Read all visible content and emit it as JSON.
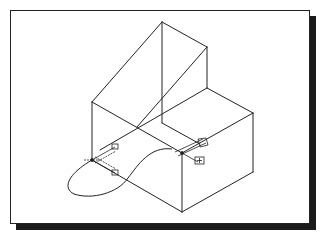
{
  "figure": {
    "colors": {
      "background": "#ffffff",
      "line": "#222222",
      "frame": "#222222",
      "shadow": "#1a1a1a"
    },
    "frame": {
      "x": 10,
      "y": 10,
      "width": 300,
      "height": 214,
      "shadow_offset": 6
    },
    "edges": [
      {
        "name": "wedge-left-slope",
        "points": [
          [
            92,
            102
          ],
          [
            162,
            22
          ]
        ]
      },
      {
        "name": "wedge-top-edge",
        "points": [
          [
            162,
            22
          ],
          [
            207,
            47
          ]
        ]
      },
      {
        "name": "wedge-right-vertical",
        "points": [
          [
            207,
            47
          ],
          [
            207,
            88
          ]
        ]
      },
      {
        "name": "center-vertical",
        "points": [
          [
            162,
            22
          ],
          [
            162,
            123
          ]
        ]
      },
      {
        "name": "wedge-diagonal",
        "points": [
          [
            207,
            47
          ],
          [
            137,
            127
          ]
        ]
      },
      {
        "name": "left-vertical",
        "points": [
          [
            92,
            102
          ],
          [
            92,
            160
          ]
        ]
      },
      {
        "name": "front-top-edge",
        "points": [
          [
            92,
            102
          ],
          [
            182,
            153
          ]
        ]
      },
      {
        "name": "step-front-edge",
        "points": [
          [
            207,
            88
          ],
          [
            100,
            150
          ]
        ]
      },
      {
        "name": "inner-step-edge",
        "points": [
          [
            162,
            123
          ],
          [
            200,
            144
          ]
        ]
      },
      {
        "name": "step-right-edge",
        "points": [
          [
            207,
            88
          ],
          [
            253,
            113
          ]
        ]
      },
      {
        "name": "box-right-vertical",
        "points": [
          [
            253,
            113
          ],
          [
            253,
            172
          ]
        ]
      },
      {
        "name": "box-top-front-edge",
        "points": [
          [
            253,
            113
          ],
          [
            182,
            153
          ]
        ]
      },
      {
        "name": "box-front-vertical",
        "points": [
          [
            182,
            153
          ],
          [
            182,
            212
          ]
        ]
      },
      {
        "name": "box-bottom-right-edge",
        "points": [
          [
            182,
            212
          ],
          [
            253,
            172
          ]
        ]
      },
      {
        "name": "base-left-edge",
        "points": [
          [
            92,
            160
          ],
          [
            182,
            212
          ]
        ]
      }
    ],
    "curve": {
      "name": "freeform-path",
      "d": "M172,149 C150,146 138,165 128,178 C118,193 92,200 74,194 C62,188 68,174 92,160"
    },
    "markers": [
      {
        "name": "left-dimension-marker",
        "anchor": [
          92,
          160
        ],
        "labels": [
          "+",
          "+"
        ]
      },
      {
        "name": "right-connector-marker",
        "anchor": [
          182,
          153
        ],
        "labels": [
          "+"
        ]
      }
    ]
  }
}
